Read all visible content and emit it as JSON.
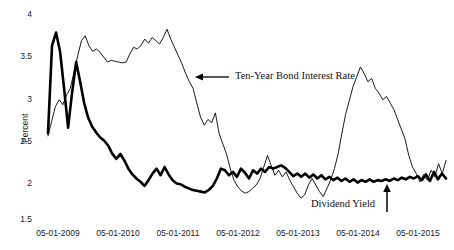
{
  "chart_data": {
    "type": "line",
    "title": "",
    "xlabel": "",
    "ylabel": "Percent",
    "ylim": [
      1.5,
      4.0
    ],
    "yticks": [
      1.5,
      2,
      2.5,
      3,
      3.5,
      4
    ],
    "ytick_labels": [
      "1.5",
      "2",
      "2.5",
      "3",
      "3.5",
      "4"
    ],
    "xtick_labels": [
      "05-01-2009",
      "05-01-2010",
      "05-01-2011",
      "05-01-2012",
      "05-01-2013",
      "05-01-2014",
      "05-01-2015"
    ],
    "grid": false,
    "legend": "none",
    "annotations": [
      {
        "text": "Ten-Year Bond Interest Rate",
        "arrow": "left",
        "target_series": "Ten-Year Bond Interest Rate"
      },
      {
        "text": "Dividend Yield",
        "arrow": "up",
        "target_series": "Dividend Yield"
      }
    ],
    "series": [
      {
        "name": "Dividend Yield",
        "style": "thick",
        "color": "#000000",
        "values": [
          2.55,
          3.62,
          3.78,
          3.55,
          3.1,
          2.62,
          3.05,
          3.42,
          3.18,
          2.92,
          2.74,
          2.63,
          2.56,
          2.5,
          2.46,
          2.4,
          2.3,
          2.24,
          2.3,
          2.22,
          2.12,
          2.05,
          2.0,
          1.96,
          1.91,
          1.98,
          2.06,
          2.12,
          2.04,
          2.14,
          2.05,
          1.98,
          1.94,
          1.93,
          1.9,
          1.88,
          1.86,
          1.85,
          1.84,
          1.83,
          1.86,
          1.91,
          2.0,
          2.12,
          2.1,
          2.04,
          2.08,
          2.02,
          2.12,
          2.07,
          2.0,
          2.1,
          2.06,
          2.12,
          2.08,
          2.14,
          2.12,
          2.14,
          2.16,
          2.13,
          2.08,
          2.03,
          2.06,
          2.02,
          2.06,
          2.01,
          2.05,
          2.0,
          2.04,
          1.99,
          2.02,
          1.98,
          2.01,
          1.97,
          2.0,
          1.96,
          1.99,
          1.95,
          1.98,
          1.96,
          1.99,
          1.96,
          1.98,
          1.97,
          1.99,
          1.97,
          2.0,
          1.98,
          2.01,
          1.99,
          2.02,
          2.0,
          2.03,
          1.98,
          2.05,
          1.97,
          2.08,
          1.99,
          2.06,
          2.0
        ]
      },
      {
        "name": "Ten-Year Bond Interest Rate",
        "style": "thin",
        "color": "#000000",
        "values": [
          2.52,
          2.7,
          2.88,
          2.96,
          2.9,
          3.02,
          3.1,
          3.3,
          3.5,
          3.68,
          3.74,
          3.62,
          3.55,
          3.58,
          3.54,
          3.48,
          3.42,
          3.44,
          3.43,
          3.42,
          3.41,
          3.42,
          3.52,
          3.6,
          3.58,
          3.62,
          3.7,
          3.65,
          3.72,
          3.68,
          3.64,
          3.72,
          3.82,
          3.7,
          3.6,
          3.5,
          3.4,
          3.28,
          3.18,
          3.1,
          2.92,
          2.75,
          2.65,
          2.72,
          2.68,
          2.8,
          2.55,
          2.42,
          2.3,
          2.12,
          1.98,
          1.9,
          1.85,
          1.82,
          1.84,
          1.88,
          1.92,
          2.0,
          2.14,
          2.28,
          2.16,
          2.04,
          2.1,
          2.02,
          2.08,
          1.98,
          1.9,
          1.82,
          1.76,
          1.8,
          1.92,
          2.0,
          1.92,
          1.84,
          1.78,
          1.88,
          1.98,
          2.12,
          2.3,
          2.55,
          2.78,
          2.95,
          3.12,
          3.24,
          3.36,
          3.28,
          3.18,
          3.22,
          3.1,
          3.04,
          2.96,
          3.0,
          2.92,
          2.84,
          2.72,
          2.6,
          2.48,
          2.28,
          2.14,
          2.06,
          1.96,
          2.05,
          1.98,
          2.1,
          2.02,
          2.18,
          2.06,
          2.22
        ]
      }
    ]
  },
  "labels": {
    "y_axis_title": "Percent",
    "annotation_bond": "Ten-Year Bond Interest Rate",
    "annotation_dividend": "Dividend Yield",
    "ytick_0": "1.5",
    "ytick_1": "2",
    "ytick_2": "2.5",
    "ytick_3": "3",
    "ytick_4": "3.5",
    "ytick_5": "4",
    "xtick_0": "05-01-2009",
    "xtick_1": "05-01-2010",
    "xtick_2": "05-01-2011",
    "xtick_3": "05-01-2012",
    "xtick_4": "05-01-2013",
    "xtick_5": "05-01-2014",
    "xtick_6": "05-01-2015"
  },
  "colors": {
    "line": "#000000",
    "text": "#1a1a1a",
    "background": "#ffffff"
  }
}
